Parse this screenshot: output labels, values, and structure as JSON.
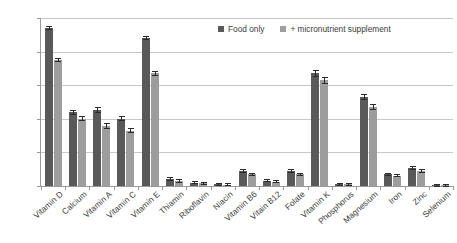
{
  "chart_data": {
    "type": "bar",
    "title": "",
    "xlabel": "",
    "ylabel": "",
    "ylim": [
      0,
      100
    ],
    "yticks": [
      "0%",
      "20%",
      "40%",
      "60%",
      "80%",
      "100%"
    ],
    "ytick_values": [
      0,
      20,
      40,
      60,
      80,
      100
    ],
    "grid": true,
    "legend_position": "top-right",
    "categories": [
      "Vitamin D",
      "Calcium",
      "Vitamin A",
      "Vitamin C",
      "Vitamin E",
      "Thiamin",
      "Riboflavin",
      "Niacin",
      "Vitamin B6",
      "Vitain B12",
      "Folate",
      "Vitamin K",
      "Phosphorus",
      "Magnesium",
      "Iron",
      "Zinc",
      "Selenium"
    ],
    "series": [
      {
        "name": "Food only",
        "color": "#595959",
        "values": [
          94,
          44,
          45,
          40,
          88,
          4,
          2,
          1,
          9,
          3,
          9,
          67,
          1,
          53,
          7,
          11,
          0.5
        ],
        "errors": [
          1.2,
          1.5,
          1.8,
          1.5,
          1.2,
          1.2,
          0.7,
          0.5,
          1.2,
          0.8,
          1.2,
          2.0,
          1.0,
          1.8,
          1.0,
          1.2,
          0.3
        ]
      },
      {
        "name": "+ micronutrient supplement",
        "color": "#9d9d9d",
        "values": [
          75,
          40,
          36,
          33,
          67,
          3,
          1.5,
          0.8,
          7,
          2.5,
          7,
          63,
          1,
          47,
          6,
          9,
          0.4
        ],
        "errors": [
          1.2,
          1.5,
          1.8,
          1.5,
          1.5,
          1.0,
          0.6,
          0.4,
          1.0,
          0.7,
          1.0,
          2.0,
          1.0,
          1.8,
          0.9,
          1.1,
          0.3
        ]
      }
    ]
  },
  "legend": {
    "entries": [
      {
        "label": "Food only",
        "color": "#595959"
      },
      {
        "label": "+ micronutrient supplement",
        "color": "#9d9d9d"
      }
    ]
  }
}
